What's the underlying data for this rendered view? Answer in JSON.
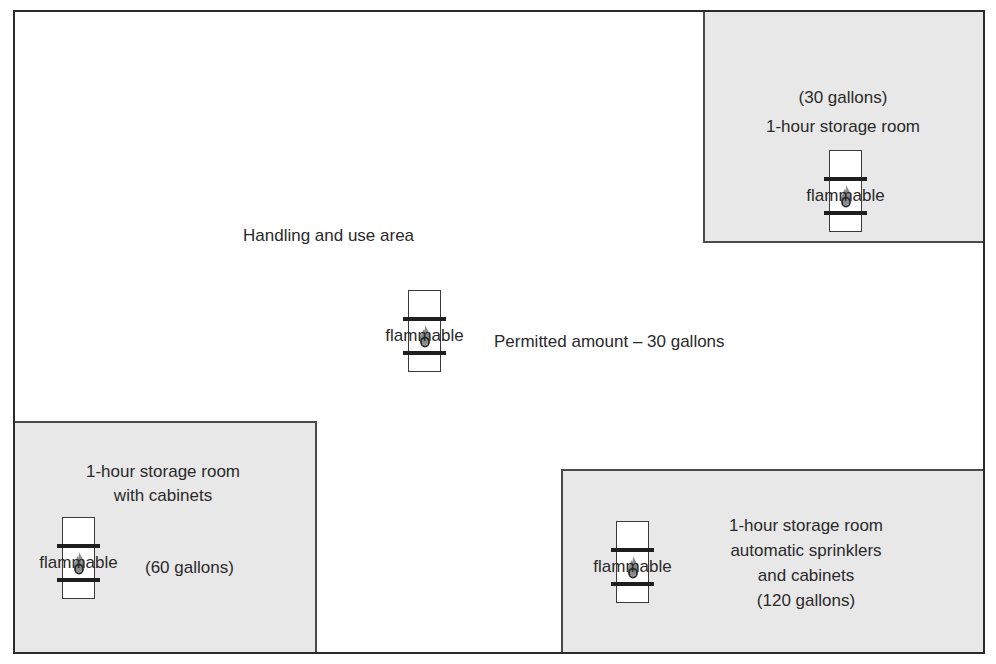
{
  "diagram": {
    "colors": {
      "outline": "#2b2b2b",
      "room_fill": "#e8e8e8",
      "drum_fill": "#ffffff",
      "drum_band": "#1e1e1e",
      "flame": "#8a8a8a",
      "text": "#2a2a2a"
    },
    "handling_area": {
      "label": "Handling and use area",
      "permitted_amount": "Permitted amount – 30 gallons",
      "drum_label": "flammable"
    },
    "rooms": [
      {
        "id": "top-right",
        "lines": [
          "(30 gallons)",
          "1-hour storage room"
        ],
        "drum_label": "flammable"
      },
      {
        "id": "bottom-left",
        "lines": [
          "1-hour storage room",
          "with cabinets"
        ],
        "capacity": "(60 gallons)",
        "drum_label": "flammable"
      },
      {
        "id": "bottom-right",
        "lines": [
          "1-hour storage room",
          "automatic sprinklers",
          "and cabinets",
          "(120 gallons)"
        ],
        "drum_label": "flammable"
      }
    ],
    "icons": {
      "drum": "flammable-drum-icon",
      "flame": "flame-icon"
    }
  }
}
